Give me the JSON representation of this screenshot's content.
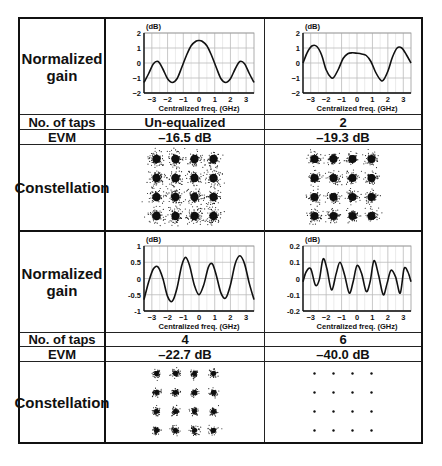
{
  "row_labels": {
    "gain": "Normalized gain",
    "gain_line1": "Normalized",
    "gain_line2": "gain",
    "taps": "No. of taps",
    "evm": "EVM",
    "constellation": "Constellation"
  },
  "panels": [
    {
      "taps": "Un-equalized",
      "evm": "–16.5 dB",
      "constellation_spread": 5.5
    },
    {
      "taps": "2",
      "evm": "–19.3 dB",
      "constellation_spread": 4.2
    },
    {
      "taps": "4",
      "evm": "–22.7 dB",
      "constellation_spread": 2.6
    },
    {
      "taps": "6",
      "evm": "–40.0 dB",
      "constellation_spread": 0.0
    }
  ],
  "chart_data": [
    {
      "type": "line",
      "title": "Normalized gain (Un-equalized)",
      "xlabel": "Centralized freq. (GHz)",
      "ylabel": "(dB)",
      "xlim": [
        -3.5,
        3.5
      ],
      "ylim": [
        -2,
        2
      ],
      "xticks": [
        -3,
        -2,
        -1,
        0,
        1,
        2,
        3
      ],
      "yticks": [
        2,
        1,
        0,
        -1,
        -2
      ],
      "ytick_labels": [
        "2",
        "1",
        "0",
        "−1",
        "−2"
      ],
      "grid": true,
      "x": [
        -3.5,
        -3.2,
        -2.9,
        -2.6,
        -2.3,
        -2.0,
        -1.7,
        -1.4,
        -1.1,
        -0.8,
        -0.5,
        -0.2,
        0,
        0.2,
        0.5,
        0.8,
        1.1,
        1.4,
        1.7,
        2.0,
        2.3,
        2.6,
        2.9,
        3.2,
        3.5
      ],
      "y": [
        -1.3,
        -0.7,
        -0.05,
        0.1,
        -0.4,
        -1.05,
        -1.3,
        -1.05,
        -0.3,
        0.5,
        1.15,
        1.45,
        1.5,
        1.45,
        1.15,
        0.5,
        -0.3,
        -1.05,
        -1.3,
        -1.05,
        -0.4,
        0.1,
        -0.05,
        -0.7,
        -1.3
      ]
    },
    {
      "type": "line",
      "title": "Normalized gain (2 taps)",
      "xlabel": "Centralized freq. (GHz)",
      "ylabel": "(dB)",
      "xlim": [
        -3.5,
        3.5
      ],
      "ylim": [
        -2,
        2
      ],
      "xticks": [
        -3,
        -2,
        -1,
        0,
        1,
        2,
        3
      ],
      "yticks": [
        2,
        1,
        0,
        -1,
        -2
      ],
      "ytick_labels": [
        "2",
        "1",
        "0",
        "−1",
        "−2"
      ],
      "grid": true,
      "x": [
        -3.5,
        -3.2,
        -2.9,
        -2.6,
        -2.3,
        -2.0,
        -1.7,
        -1.5,
        -1.2,
        -0.9,
        -0.6,
        -0.3,
        0,
        0.3,
        0.6,
        0.9,
        1.2,
        1.5,
        1.7,
        2.0,
        2.3,
        2.6,
        2.9,
        3.2,
        3.5
      ],
      "y": [
        0.0,
        0.75,
        1.15,
        1.1,
        0.55,
        -0.45,
        -0.95,
        -0.95,
        -0.4,
        0.3,
        0.62,
        0.68,
        0.65,
        0.6,
        0.5,
        0.1,
        -0.6,
        -1.1,
        -1.15,
        -0.55,
        0.4,
        1.0,
        1.0,
        0.55,
        0.0
      ]
    },
    {
      "type": "line",
      "title": "Normalized gain (4 taps)",
      "xlabel": "Centralized freq. (GHz)",
      "ylabel": "(dB)",
      "xlim": [
        -3.5,
        3.5
      ],
      "ylim": [
        -1,
        1
      ],
      "xticks": [
        -3,
        -2,
        -1,
        0,
        1,
        2,
        3
      ],
      "yticks": [
        1,
        0.5,
        0,
        -0.5,
        -1
      ],
      "ytick_labels": [
        "1",
        "0.5",
        "0",
        "-0.5",
        "-1"
      ],
      "grid": true,
      "x": [
        -3.5,
        -3.2,
        -2.9,
        -2.6,
        -2.3,
        -2.0,
        -1.7,
        -1.4,
        -1.1,
        -0.85,
        -0.6,
        -0.3,
        0,
        0.3,
        0.6,
        0.85,
        1.1,
        1.4,
        1.7,
        2.0,
        2.3,
        2.6,
        2.9,
        3.2,
        3.5
      ],
      "y": [
        -0.65,
        -0.1,
        0.3,
        0.35,
        0.0,
        -0.55,
        -0.7,
        -0.3,
        0.4,
        0.65,
        0.4,
        -0.2,
        -0.5,
        -0.2,
        0.35,
        0.45,
        0.1,
        -0.45,
        -0.6,
        -0.2,
        0.45,
        0.7,
        0.45,
        -0.15,
        -0.65
      ]
    },
    {
      "type": "line",
      "title": "Normalized gain (6 taps)",
      "xlabel": "Centralized freq. (GHz)",
      "ylabel": "(dB)",
      "xlim": [
        -3.5,
        3.5
      ],
      "ylim": [
        -0.2,
        0.2
      ],
      "xticks": [
        -3,
        -2,
        -1,
        0,
        1,
        2,
        3
      ],
      "yticks": [
        0.2,
        0.1,
        0,
        -0.1,
        -0.2
      ],
      "ytick_labels": [
        "0.2",
        "0.1",
        "0",
        "-0.1",
        "-0.2"
      ],
      "grid": true,
      "x": [
        -3.5,
        -3.3,
        -3.0,
        -2.7,
        -2.45,
        -2.2,
        -1.95,
        -1.65,
        -1.35,
        -1.1,
        -0.8,
        -0.5,
        -0.25,
        0,
        0.3,
        0.6,
        0.85,
        1.1,
        1.4,
        1.7,
        1.95,
        2.2,
        2.5,
        2.8,
        3.05,
        3.3,
        3.5
      ],
      "y": [
        -0.02,
        0.04,
        0.06,
        -0.04,
        -0.01,
        0.12,
        0.06,
        -0.07,
        0.03,
        0.1,
        0.02,
        -0.09,
        -0.02,
        0.08,
        0.03,
        -0.08,
        -0.02,
        0.11,
        0.02,
        -0.1,
        -0.03,
        0.05,
        0.01,
        -0.09,
        0.06,
        0.04,
        -0.02
      ]
    }
  ]
}
